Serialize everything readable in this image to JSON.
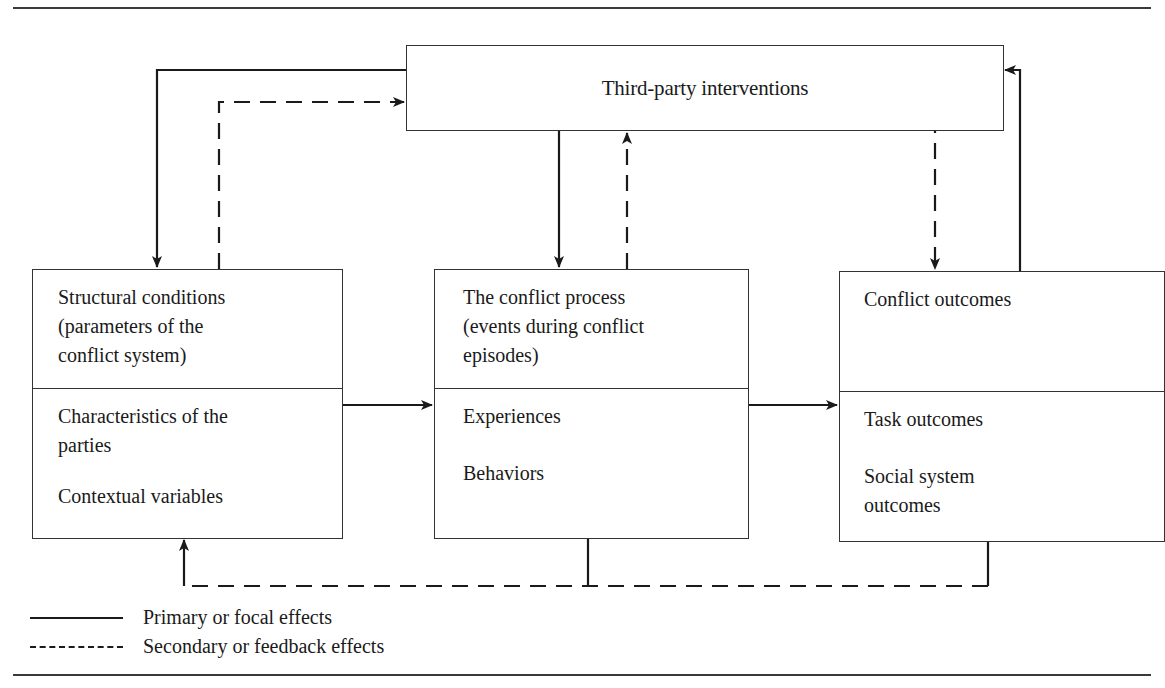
{
  "diagram": {
    "top_box": {
      "label": "Third-party interventions"
    },
    "boxes": [
      {
        "id": "structural-conditions",
        "upper": [
          "Structural conditions",
          "(parameters of the",
          "conflict system)"
        ],
        "lower": [
          "Characteristics of the",
          "parties",
          "",
          "Contextual variables"
        ]
      },
      {
        "id": "conflict-process",
        "upper": [
          "The conflict process",
          "(events during conflict",
          "episodes)"
        ],
        "lower": [
          "Experiences",
          "",
          "Behaviors"
        ]
      },
      {
        "id": "conflict-outcomes",
        "upper": [
          "Conflict outcomes"
        ],
        "lower": [
          "Task outcomes",
          "",
          "Social system",
          "outcomes"
        ]
      }
    ],
    "edges": [
      {
        "from": "Third-party interventions",
        "to": "Structural conditions",
        "style": "solid"
      },
      {
        "from": "Structural conditions",
        "to": "Third-party interventions",
        "style": "dashed"
      },
      {
        "from": "Third-party interventions",
        "to": "The conflict process",
        "style": "solid"
      },
      {
        "from": "The conflict process",
        "to": "Third-party interventions",
        "style": "dashed"
      },
      {
        "from": "Conflict outcomes",
        "to": "Third-party interventions",
        "style": "solid"
      },
      {
        "from": "Third-party interventions",
        "to": "Conflict outcomes",
        "style": "dashed"
      },
      {
        "from": "Structural conditions",
        "to": "The conflict process",
        "style": "solid"
      },
      {
        "from": "The conflict process",
        "to": "Conflict outcomes",
        "style": "solid"
      },
      {
        "from": "The conflict process",
        "to": "Structural conditions",
        "style": "dashed"
      },
      {
        "from": "Conflict outcomes",
        "to": "Structural conditions",
        "style": "dashed"
      }
    ],
    "legend": {
      "solid_label": "Primary or focal effects",
      "dashed_label": "Secondary or feedback effects"
    },
    "colors": {
      "stroke": "#1a1a1a",
      "border": "#333333",
      "background": "#ffffff"
    }
  }
}
